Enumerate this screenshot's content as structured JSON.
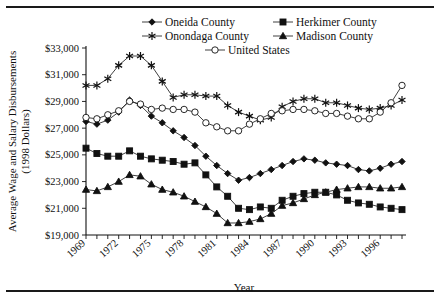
{
  "chart_data": {
    "type": "line",
    "title": "",
    "xlabel": "Year",
    "ylabel": "Average Wage and Salary Disbursements (1998 Dollars)",
    "ylabel_line1": "Average Wage and Salary Disbursements",
    "ylabel_line2": "(1998 Dollars)",
    "grid": false,
    "legend_position": "top",
    "ylim": [
      19000,
      33000
    ],
    "ytick_step": 2000,
    "ytick_labels": [
      "$33,000",
      "$31,000",
      "$29,000",
      "$27,000",
      "$25,000",
      "$23,000",
      "$21,000",
      "$19,000"
    ],
    "ytick_values": [
      33000,
      31000,
      29000,
      27000,
      25000,
      23000,
      21000,
      19000
    ],
    "xlim": [
      1969,
      1998
    ],
    "xtick_labels": [
      "1969",
      "1972",
      "1975",
      "1978",
      "1981",
      "1984",
      "1987",
      "1990",
      "1993",
      "1996"
    ],
    "xtick_values": [
      1969,
      1972,
      1975,
      1978,
      1981,
      1984,
      1987,
      1990,
      1993,
      1996
    ],
    "x": [
      1969,
      1970,
      1971,
      1972,
      1973,
      1974,
      1975,
      1976,
      1977,
      1978,
      1979,
      1980,
      1981,
      1982,
      1983,
      1984,
      1985,
      1986,
      1987,
      1988,
      1989,
      1990,
      1991,
      1992,
      1993,
      1994,
      1995,
      1996,
      1997,
      1998
    ],
    "series": [
      {
        "name": "Oneida County",
        "marker": "diamond",
        "values": [
          27500,
          27300,
          27600,
          28200,
          29100,
          28700,
          27900,
          27400,
          26800,
          26300,
          25700,
          24900,
          24200,
          23600,
          23100,
          23300,
          23600,
          23900,
          24200,
          24500,
          24700,
          24600,
          24400,
          24300,
          24200,
          23900,
          23800,
          24000,
          24300,
          24500
        ]
      },
      {
        "name": "Herkimer County",
        "marker": "square",
        "values": [
          25500,
          25100,
          24900,
          24900,
          25300,
          24900,
          24700,
          24600,
          24500,
          24300,
          24400,
          23500,
          22600,
          21900,
          21000,
          20900,
          21100,
          21000,
          21600,
          21900,
          22100,
          22200,
          22200,
          22000,
          21600,
          21400,
          21300,
          21100,
          21000,
          20900
        ]
      },
      {
        "name": "Onondaga County",
        "marker": "star",
        "values": [
          30200,
          30200,
          30700,
          31700,
          32400,
          32400,
          31700,
          30500,
          29300,
          29500,
          29500,
          29400,
          29400,
          28700,
          28200,
          27900,
          27600,
          27800,
          28600,
          29000,
          29200,
          29200,
          28900,
          28900,
          28700,
          28500,
          28400,
          28500,
          28700,
          29100
        ]
      },
      {
        "name": "Madison County",
        "marker": "triangle",
        "values": [
          22400,
          22300,
          22600,
          23000,
          23500,
          23400,
          22800,
          22400,
          22200,
          21900,
          21500,
          21100,
          20600,
          19900,
          19900,
          20000,
          20200,
          20600,
          21200,
          21400,
          21700,
          22000,
          22200,
          22400,
          22500,
          22600,
          22600,
          22500,
          22500,
          22600
        ]
      },
      {
        "name": "United States",
        "marker": "circle",
        "values": [
          27800,
          27700,
          28000,
          28300,
          29000,
          28800,
          28400,
          28500,
          28400,
          28400,
          28200,
          27400,
          27100,
          26800,
          26800,
          27300,
          27700,
          28100,
          28300,
          28400,
          28400,
          28300,
          28100,
          28100,
          27900,
          27700,
          27700,
          28200,
          28900,
          30200
        ]
      }
    ]
  },
  "legend": {
    "items": [
      {
        "label": "Oneida County",
        "marker": "diamond"
      },
      {
        "label": "Herkimer County",
        "marker": "square"
      },
      {
        "label": "Onondaga County",
        "marker": "star"
      },
      {
        "label": "Madison County",
        "marker": "triangle"
      },
      {
        "label": "United States",
        "marker": "circle"
      }
    ]
  }
}
